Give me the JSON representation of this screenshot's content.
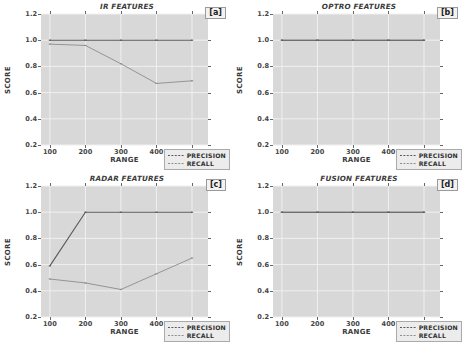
{
  "figure": {
    "panel_count": 4,
    "axis": {
      "xlabel": "RANGE",
      "ylabel": "SCORE",
      "xticks": [
        "100",
        "200",
        "300",
        "400",
        "500"
      ],
      "yticks": [
        "0.2",
        "0.4",
        "0.6",
        "0.8",
        "1.0",
        "1.2"
      ]
    },
    "legend": {
      "precision_label": "PRECISION",
      "recall_label": "RECALL"
    },
    "colors": {
      "plot_background": "#d8d8d8",
      "grid": "#f0f0f0",
      "precision_line": "#5a5a5a",
      "recall_line": "#8c8c8c",
      "text": "#3a3a3a"
    },
    "tags": {
      "a": "[a]",
      "b": "[b]",
      "c": "[c]",
      "d": "[d]"
    }
  },
  "chart_data": [
    {
      "type": "line",
      "title": "IR FEATURES",
      "tag": "[a]",
      "xlabel": "RANGE",
      "ylabel": "SCORE",
      "x": [
        100,
        200,
        300,
        400,
        500
      ],
      "xlim": [
        75,
        545
      ],
      "ylim": [
        0.2,
        1.2
      ],
      "grid": true,
      "legend_position": "lower right",
      "series": [
        {
          "name": "PRECISION",
          "values": [
            1.0,
            1.0,
            1.0,
            1.0,
            1.0
          ]
        },
        {
          "name": "RECALL",
          "values": [
            0.97,
            0.96,
            0.82,
            0.67,
            0.69
          ]
        }
      ]
    },
    {
      "type": "line",
      "title": "OPTRO FEATURES",
      "tag": "[b]",
      "xlabel": "RANGE",
      "ylabel": "SCORE",
      "x": [
        100,
        200,
        300,
        400,
        500
      ],
      "xlim": [
        75,
        545
      ],
      "ylim": [
        0.2,
        1.2
      ],
      "grid": true,
      "legend_position": "lower right",
      "series": [
        {
          "name": "PRECISION",
          "values": [
            1.0,
            1.0,
            1.0,
            1.0,
            1.0
          ]
        },
        {
          "name": "RECALL",
          "values": [
            1.0,
            1.0,
            1.0,
            1.0,
            1.0
          ]
        }
      ]
    },
    {
      "type": "line",
      "title": "RADAR FEATURES",
      "tag": "[c]",
      "xlabel": "RANGE",
      "ylabel": "SCORE",
      "x": [
        100,
        200,
        300,
        400,
        500
      ],
      "xlim": [
        75,
        545
      ],
      "ylim": [
        0.2,
        1.2
      ],
      "grid": true,
      "legend_position": "lower right",
      "series": [
        {
          "name": "PRECISION",
          "values": [
            0.59,
            1.0,
            1.0,
            1.0,
            1.0
          ]
        },
        {
          "name": "RECALL",
          "values": [
            0.49,
            0.46,
            0.41,
            0.53,
            0.65
          ]
        }
      ]
    },
    {
      "type": "line",
      "title": "FUSION FEATURES",
      "tag": "[d]",
      "xlabel": "RANGE",
      "ylabel": "SCORE",
      "x": [
        100,
        200,
        300,
        400,
        500
      ],
      "xlim": [
        75,
        545
      ],
      "ylim": [
        0.2,
        1.2
      ],
      "grid": true,
      "legend_position": "lower right",
      "series": [
        {
          "name": "PRECISION",
          "values": [
            1.0,
            1.0,
            1.0,
            1.0,
            1.0
          ]
        },
        {
          "name": "RECALL",
          "values": [
            1.0,
            1.0,
            1.0,
            1.0,
            1.0
          ]
        }
      ]
    }
  ]
}
